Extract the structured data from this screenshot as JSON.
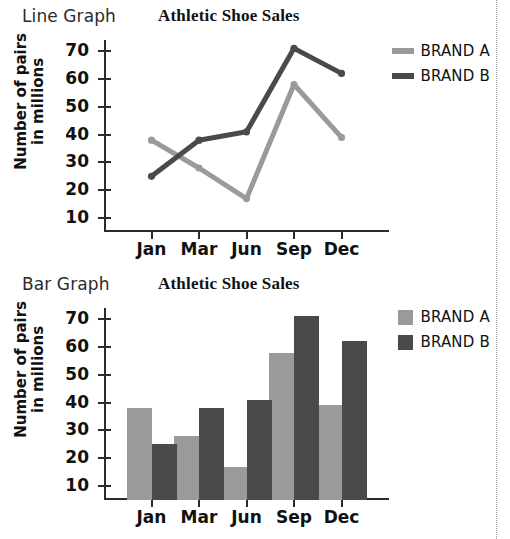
{
  "figures": [
    {
      "kicker": "Line Graph",
      "title": "Athletic Shoe Sales",
      "ylabel_line1": "Number of pairs",
      "ylabel_line2": "in millions"
    },
    {
      "kicker": "Bar Graph",
      "title": "Athletic Shoe Sales",
      "ylabel_line1": "Number of pairs",
      "ylabel_line2": "in millions"
    }
  ],
  "legend": {
    "brand_a": "BRAND A",
    "brand_b": "BRAND B"
  },
  "colors": {
    "brand_a": "#9a9a9a",
    "brand_b": "#4a4a4a",
    "axis": "#2a2a2a"
  },
  "chart_data": [
    {
      "type": "line",
      "title": "Athletic Shoe Sales",
      "xlabel": "",
      "ylabel": "Number of pairs in millions",
      "categories": [
        "Jan",
        "Mar",
        "Jun",
        "Sep",
        "Dec"
      ],
      "yticks": [
        10,
        20,
        30,
        40,
        50,
        60,
        70
      ],
      "ylim": [
        5,
        74
      ],
      "grid": false,
      "legend_position": "right",
      "series": [
        {
          "name": "BRAND A",
          "color": "#9a9a9a",
          "values": [
            38,
            28,
            17,
            58,
            39
          ]
        },
        {
          "name": "BRAND B",
          "color": "#4a4a4a",
          "values": [
            25,
            38,
            41,
            71,
            62
          ]
        }
      ]
    },
    {
      "type": "bar",
      "title": "Athletic Shoe Sales",
      "xlabel": "",
      "ylabel": "Number of pairs in millions",
      "categories": [
        "Jan",
        "Mar",
        "Jun",
        "Sep",
        "Dec"
      ],
      "yticks": [
        10,
        20,
        30,
        40,
        50,
        60,
        70
      ],
      "ylim": [
        5,
        74
      ],
      "grid": false,
      "legend_position": "right",
      "series": [
        {
          "name": "BRAND A",
          "color": "#9a9a9a",
          "values": [
            38,
            28,
            17,
            58,
            39
          ]
        },
        {
          "name": "BRAND B",
          "color": "#4a4a4a",
          "values": [
            25,
            38,
            41,
            71,
            62
          ]
        }
      ]
    }
  ]
}
